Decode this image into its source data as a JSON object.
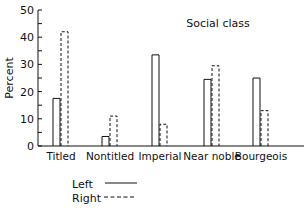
{
  "chart_data": {
    "type": "bar",
    "title": "Social class",
    "xlabel": "",
    "ylabel": "Percent",
    "ylim": [
      0,
      50
    ],
    "yticks": [
      0,
      10,
      20,
      30,
      40,
      50
    ],
    "grid": false,
    "legend_position": "bottom-left",
    "categories": [
      "Titled",
      "Nontitled",
      "Imperial",
      "Near noble",
      "Bourgeois"
    ],
    "series": [
      {
        "name": "Left",
        "style": "solid",
        "values": [
          17.5,
          3.5,
          33.5,
          24.5,
          25
        ]
      },
      {
        "name": "Right",
        "style": "dashed",
        "values": [
          42,
          11,
          8,
          29.5,
          13
        ]
      }
    ]
  },
  "legend": {
    "left_label": "Left",
    "right_label": "Right"
  }
}
